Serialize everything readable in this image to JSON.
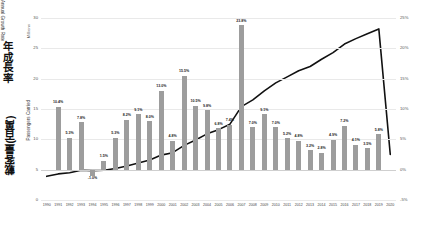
{
  "chart_data": {
    "type": "bar",
    "title": "",
    "subtitle": "",
    "xlabel": "",
    "ylabel": "Millions",
    "grid": true,
    "legend_position": "none",
    "categories": [
      "1990",
      "1991",
      "1992",
      "1993",
      "1994",
      "1995",
      "1996",
      "1997",
      "1998",
      "1999",
      "2000",
      "2001",
      "2002",
      "2003",
      "2004",
      "2005",
      "2006",
      "2007",
      "2008",
      "2009",
      "2010",
      "2011",
      "2012",
      "2013",
      "2014",
      "2015",
      "2016",
      "2017",
      "2018",
      "2019",
      "2020"
    ],
    "left_axis": {
      "label_en": "Passengers Carried",
      "label_zh": "載客量(百萬)",
      "unit_label": "Millions",
      "ticks": [
        "0",
        "5",
        "10",
        "15",
        "20",
        "25",
        "30"
      ],
      "ylim": [
        0,
        30
      ]
    },
    "right_axis": {
      "label_en": "Annual Growth Rate",
      "label_zh": "年成長率",
      "ticks": [
        "-5%",
        "0%",
        "5%",
        "10%",
        "15%",
        "20%",
        "25%"
      ],
      "ylim": [
        -5,
        25
      ]
    },
    "series": [
      {
        "name": "Annual Growth Rate",
        "type": "bar",
        "axis": "right",
        "unit": "%",
        "color": "#9d9d9d",
        "values": [
          null,
          10.4,
          5.3,
          7.8,
          -1.0,
          1.5,
          5.3,
          8.2,
          9.1,
          8.0,
          13.0,
          4.8,
          15.5,
          10.5,
          9.8,
          6.8,
          7.4,
          23.8,
          7.0,
          9.1,
          7.0,
          5.2,
          4.8,
          3.2,
          2.8,
          4.9,
          7.2,
          4.1,
          3.5,
          5.8,
          null
        ],
        "labels": [
          "",
          "10.4%",
          "5.3%",
          "7.8%",
          "-1.0%",
          "1.5%",
          "5.3%",
          "8.2%",
          "9.1%",
          "8.0%",
          "13.0%",
          "4.8%",
          "15.5%",
          "10.5%",
          "9.8%",
          "6.8%",
          "7.4%",
          "23.8%",
          "7.0%",
          "9.1%",
          "7.0%",
          "5.2%",
          "4.8%",
          "3.2%",
          "2.8%",
          "4.9%",
          "7.2%",
          "4.1%",
          "3.5%",
          "5.8%",
          ""
        ]
      },
      {
        "name": "Passengers Carried",
        "type": "line",
        "axis": "left",
        "unit": "Millions",
        "color": "#111111",
        "values": [
          3.9,
          4.3,
          4.5,
          4.9,
          4.85,
          4.9,
          5.2,
          5.6,
          6.1,
          6.6,
          7.4,
          7.8,
          9.0,
          9.9,
          10.9,
          11.6,
          12.5,
          15.4,
          16.5,
          18.0,
          19.3,
          20.3,
          21.3,
          22.0,
          23.2,
          24.3,
          25.7,
          26.6,
          27.4,
          28.2,
          7.5
        ]
      }
    ],
    "annotations": [
      {
        "text": "Sharp decline in 2020",
        "visible": false
      }
    ]
  }
}
